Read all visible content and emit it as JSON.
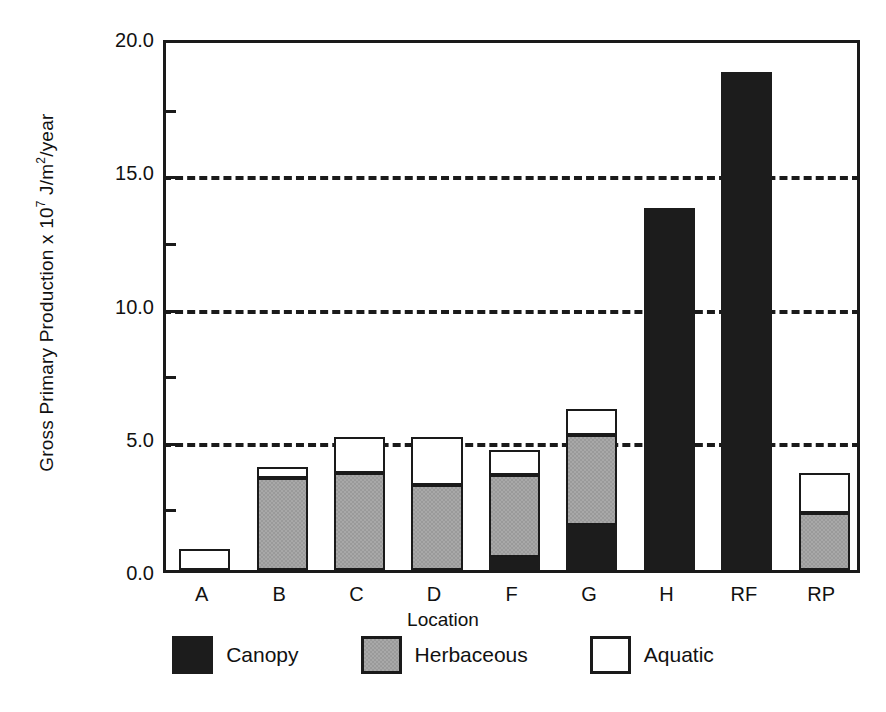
{
  "chart_data": {
    "type": "bar",
    "subtype": "stacked",
    "title": "",
    "xlabel": "Location",
    "ylabel": "Gross Primary Production  x 10^7 J/m^2/year",
    "ylabel_parts": {
      "prefix": "Gross Primary Production  x 10",
      "exponent": "7",
      "mid": " J/m",
      "exponent2": "2",
      "suffix": "/year"
    },
    "categories": [
      "A",
      "B",
      "C",
      "D",
      "F",
      "G",
      "H",
      "RF",
      "RP"
    ],
    "series": [
      {
        "name": "Canopy",
        "color": "#1c1c1c",
        "values": [
          0.0,
          0.0,
          0.0,
          0.0,
          0.5,
          1.7,
          13.6,
          18.7,
          0.0
        ]
      },
      {
        "name": "Herbaceous",
        "color": "#a8a8a8",
        "values": [
          0.0,
          3.45,
          3.65,
          3.2,
          3.05,
          3.35,
          0.0,
          0.0,
          2.15
        ]
      },
      {
        "name": "Aquatic",
        "color": "#ffffff",
        "values": [
          0.8,
          0.4,
          1.35,
          1.8,
          0.95,
          1.0,
          0.0,
          0.0,
          1.5
        ]
      }
    ],
    "totals": [
      0.8,
      3.85,
      5.0,
      5.0,
      4.5,
      6.05,
      13.6,
      18.7,
      3.65
    ],
    "ylim": [
      0.0,
      20.0
    ],
    "yticks_major": [
      0.0,
      5.0,
      10.0,
      15.0,
      20.0
    ],
    "yticks_major_labels": [
      "0.0",
      "5.0",
      "10.0",
      "15.0",
      "20.0"
    ],
    "yticks_minor": [
      2.5,
      7.5,
      12.5,
      17.5
    ],
    "gridlines": [
      5.0,
      10.0,
      15.0
    ],
    "grid": true,
    "grid_style": "dashed",
    "legend_position": "bottom",
    "legend": [
      "Canopy",
      "Herbaceous",
      "Aquatic"
    ]
  }
}
